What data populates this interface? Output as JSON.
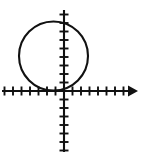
{
  "figure": {
    "width": 141,
    "height": 157,
    "background_color": "#ffffff",
    "ink_color": "#111111"
  },
  "axes": {
    "origin_px": {
      "x": 64,
      "y": 91
    },
    "unit_px": 8.5,
    "x_axis": {
      "name": "x-axis",
      "start_px": 2,
      "end_px": 138,
      "y_px": 91,
      "arrowhead": "right",
      "tick_length_px": 9,
      "tick_units": [
        -7,
        -6,
        -5,
        -4,
        -3,
        -2,
        -1,
        1,
        2,
        3,
        4,
        5,
        6,
        7
      ],
      "labels_shown": false
    },
    "y_axis": {
      "name": "y-axis",
      "start_px": 10,
      "end_px": 152,
      "x_px": 64,
      "arrowhead": "none",
      "tick_length_px": 9,
      "tick_units": [
        -7,
        -6,
        -5,
        -4,
        -3,
        -2,
        -1,
        1,
        2,
        3,
        4,
        5,
        6,
        7,
        8,
        9
      ],
      "labels_shown": false
    }
  },
  "chart_data": {
    "type": "line",
    "title": "",
    "subtitle": "",
    "xlabel": "",
    "ylabel": "",
    "grid": false,
    "legend": "none",
    "xlim": [
      -7.3,
      8.7
    ],
    "ylim": [
      -7.2,
      9.5
    ],
    "shapes": [
      {
        "kind": "circle",
        "name": "circle-curve",
        "center": [
          -1.2,
          4.1
        ],
        "radius": 4.1,
        "center_px": [
          53.5,
          56
        ],
        "radius_px": 34.5,
        "tangent_to": "x-axis",
        "stroke": "#111111",
        "fill": "none"
      }
    ],
    "annotations": []
  }
}
